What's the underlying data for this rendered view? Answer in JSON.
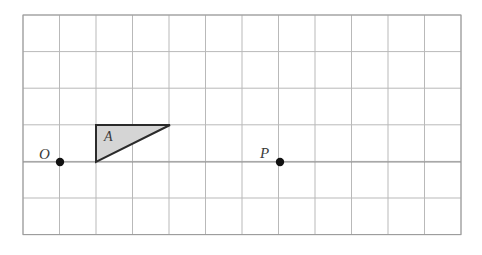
{
  "figure": {
    "kind": "coordinate-grid-diagram",
    "canvas": {
      "width": 482,
      "height": 255,
      "background": "#ffffff"
    },
    "grid": {
      "origin_px": {
        "x": 23,
        "y": 15
      },
      "cell_width": 36.5,
      "cell_height": 36.6,
      "columns": 12,
      "rows": 6,
      "line_color": "#b9b9b9",
      "border_color": "#9a9a9a",
      "line_width": 1
    },
    "axis_line": {
      "name": "horizontal-baseline",
      "y_px": 162,
      "x_start_px": 23,
      "x_end_px": 461,
      "color": "#8f8f8f"
    },
    "shape": {
      "name": "triangle-A",
      "type": "right-triangle",
      "label": "A",
      "fill": "#d5d5d5",
      "stroke": "#2b2b2b",
      "stroke_width": 2,
      "vertices_px": [
        {
          "x": 96,
          "y": 125
        },
        {
          "x": 170,
          "y": 125
        },
        {
          "x": 96,
          "y": 162
        }
      ],
      "right_angle_at": "bottom-left",
      "width_cells": 2,
      "height_cells": 1
    },
    "points": [
      {
        "id": "O",
        "label": "O",
        "x_px": 60,
        "y_px": 162,
        "radius_px": 4.2,
        "color": "#111111",
        "label_offset_px": {
          "x": -21,
          "y": -15
        }
      },
      {
        "id": "P",
        "label": "P",
        "x_px": 280,
        "y_px": 162,
        "radius_px": 4.2,
        "color": "#111111",
        "label_offset_px": {
          "x": -20,
          "y": -16
        }
      }
    ]
  }
}
